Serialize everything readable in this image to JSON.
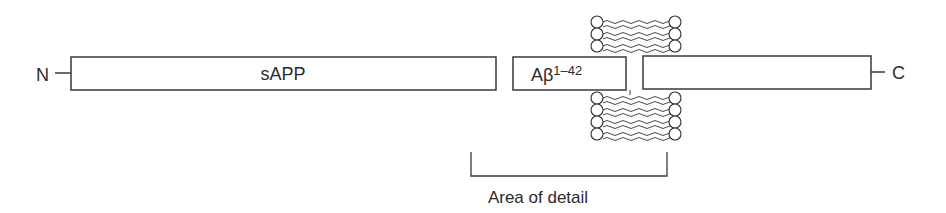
{
  "diagram": {
    "type": "protein-domain-schematic",
    "n_terminus_label": "N",
    "c_terminus_label": "C",
    "domains": [
      {
        "id": "sapp",
        "label": "sAPP"
      },
      {
        "id": "abeta",
        "label_base": "Aβ",
        "label_superscript": "1–42"
      },
      {
        "id": "c-terminal",
        "label": ""
      }
    ],
    "membrane": {
      "description": "lipid bilayer",
      "upper_leaflet_heads_per_side": 3,
      "lower_leaflet_heads_per_side": 4
    },
    "bracket_label": "Area of detail"
  },
  "colors": {
    "stroke": "#3a3a3a",
    "text": "#2b2b2b",
    "background": "#ffffff"
  }
}
